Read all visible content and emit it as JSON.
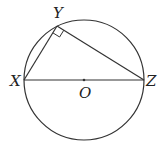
{
  "diagram": {
    "type": "geometry",
    "colors": {
      "stroke": "#333333",
      "label": "#222222",
      "background": "#ffffff"
    },
    "circle": {
      "center_label": "O",
      "cx": 84,
      "cy": 80,
      "r": 60
    },
    "points": {
      "X": {
        "label": "X",
        "x": 24,
        "y": 80
      },
      "Y": {
        "label": "Y",
        "x": 57,
        "y": 26
      },
      "Z": {
        "label": "Z",
        "x": 144,
        "y": 80
      },
      "O": {
        "label": "O",
        "x": 84,
        "y": 80
      }
    },
    "segments": [
      "XY",
      "YZ",
      "XZ"
    ],
    "right_angle_at": "Y"
  }
}
